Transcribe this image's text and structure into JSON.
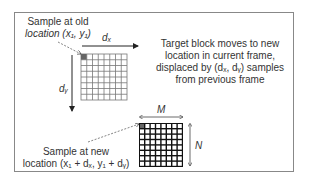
{
  "diagram": {
    "old_label": {
      "line1": "Sample at old",
      "line2": "location (x₁, y₁)"
    },
    "dx_label": "dₓ",
    "dy_label": "dᵧ",
    "description": {
      "line1": "Target block moves to new",
      "line2": "location in current frame,",
      "line3": "displaced by (dₓ, dᵧ) samples",
      "line4": "from previous frame"
    },
    "new_label": {
      "line1": "Sample at new",
      "line2": "location (x₁ + dₓ, y₁ + dᵧ)"
    },
    "m_label": "M",
    "n_label": "N",
    "colors": {
      "frame": "#888888",
      "grid_old": "#777777",
      "grid_new": "#111111",
      "highlight": "#666666"
    }
  }
}
